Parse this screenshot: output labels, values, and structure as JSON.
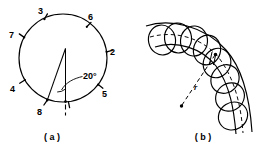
{
  "figure": {
    "panels": [
      {
        "id": "a",
        "caption": "( a )",
        "type": "circle-with-angle",
        "angle_label": "20°",
        "tick_labels": [
          "3",
          "6",
          "2",
          "5",
          "8",
          "4",
          "7"
        ],
        "ticks": [
          {
            "label": "3",
            "angle_deg": 115,
            "label_x": 38,
            "label_y": 14,
            "tx": 42.5,
            "ty": 17.5
          },
          {
            "label": "6",
            "angle_deg": 57,
            "label_x": 90,
            "label_y": 22,
            "tx": 88.0,
            "ty": 25.5
          },
          {
            "label": "2",
            "angle_deg": 8,
            "label_x": 110,
            "label_y": 55,
            "tx": 105.5,
            "ty": 52.0
          },
          {
            "label": "5",
            "angle_deg": -37,
            "label_x": 92,
            "label_y": 111,
            "tx": 93.0,
            "ty": 100.0
          },
          {
            "label": "8",
            "angle_deg": -83,
            "label_x": 38,
            "label_y": 119,
            "tx": 48.5,
            "ty": 110.0
          },
          {
            "label": "4",
            "angle_deg": -150,
            "label_x": 10,
            "label_y": 96,
            "tx": 19.0,
            "ty": 92.0
          },
          {
            "label": "7",
            "angle_deg": 152,
            "label_x": 9,
            "label_y": 38,
            "tx": 19.5,
            "ty": 38.5
          }
        ],
        "circle": {
          "cx": 63,
          "cy": 58,
          "r": 44
        }
      },
      {
        "id": "b",
        "caption": "( b )",
        "type": "circle-chain-on-arc",
        "radius_label": "r",
        "circle_count": 8
      }
    ],
    "colors": {
      "ink": "#000000",
      "background": "#ffffff"
    }
  }
}
